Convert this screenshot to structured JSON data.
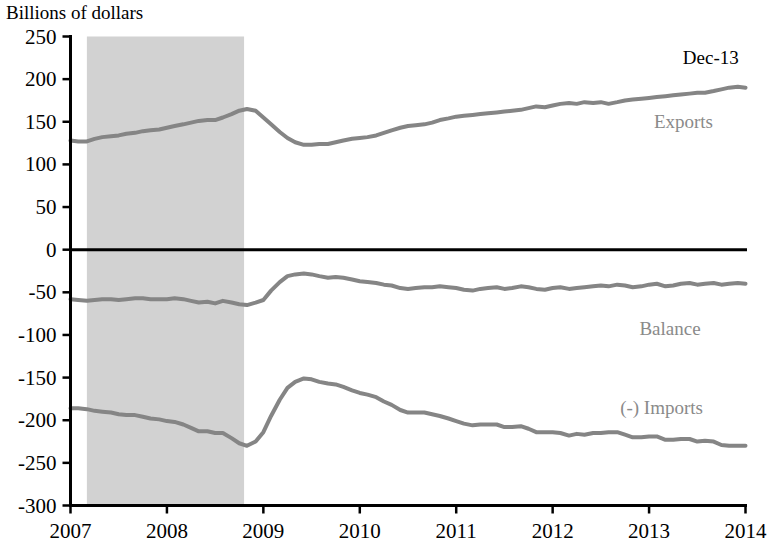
{
  "chart_data": {
    "type": "line",
    "title": "",
    "ylabel": "Billions of dollars",
    "xlabel": "",
    "ylim": [
      -300,
      250
    ],
    "xlim": [
      2007.0,
      2014.0
    ],
    "grid": false,
    "legend_position": "inline-right",
    "ytick_labels": [
      "250",
      "200",
      "150",
      "100",
      "50",
      "0",
      "-50",
      "-100",
      "-150",
      "-200",
      "-250",
      "-300"
    ],
    "yticks": [
      250,
      200,
      150,
      100,
      50,
      0,
      -50,
      -100,
      -150,
      -200,
      -250,
      -300
    ],
    "xtick_labels": [
      "2007",
      "2008",
      "2009",
      "2010",
      "2011",
      "2012",
      "2013",
      "2014"
    ],
    "xticks": [
      2007,
      2008,
      2009,
      2010,
      2011,
      2012,
      2013,
      2014
    ],
    "annotations": [
      {
        "name": "latest-period",
        "text": "Dec-13",
        "x": 2013.35,
        "y": 218
      }
    ],
    "shaded_regions": [
      {
        "name": "recession-band",
        "x_start": 2007.17,
        "x_end": 2008.8,
        "color": "#d2d2d2"
      }
    ],
    "zero_line": 0,
    "line_color": "#858585",
    "series": [
      {
        "name": "Exports",
        "label": "Exports",
        "label_x": 2013.05,
        "label_y": 143,
        "color": "#858585",
        "x": [
          2007.0,
          2007.08,
          2007.17,
          2007.25,
          2007.33,
          2007.42,
          2007.5,
          2007.58,
          2007.67,
          2007.75,
          2007.83,
          2007.92,
          2008.0,
          2008.08,
          2008.17,
          2008.25,
          2008.33,
          2008.42,
          2008.5,
          2008.58,
          2008.67,
          2008.75,
          2008.83,
          2008.92,
          2009.0,
          2009.08,
          2009.17,
          2009.25,
          2009.33,
          2009.42,
          2009.5,
          2009.58,
          2009.67,
          2009.75,
          2009.83,
          2009.92,
          2010.0,
          2010.08,
          2010.17,
          2010.25,
          2010.33,
          2010.42,
          2010.5,
          2010.58,
          2010.67,
          2010.75,
          2010.83,
          2010.92,
          2011.0,
          2011.08,
          2011.17,
          2011.25,
          2011.33,
          2011.42,
          2011.5,
          2011.58,
          2011.67,
          2011.75,
          2011.83,
          2011.92,
          2012.0,
          2012.08,
          2012.17,
          2012.25,
          2012.33,
          2012.42,
          2012.5,
          2012.58,
          2012.67,
          2012.75,
          2012.83,
          2012.92,
          2013.0,
          2013.08,
          2013.17,
          2013.25,
          2013.33,
          2013.42,
          2013.5,
          2013.58,
          2013.67,
          2013.75,
          2013.83,
          2013.92,
          2014.0
        ],
        "values": [
          128,
          127,
          127,
          130,
          132,
          133,
          134,
          136,
          137,
          139,
          140,
          141,
          143,
          145,
          147,
          149,
          151,
          152,
          152,
          155,
          159,
          163,
          165,
          163,
          155,
          147,
          138,
          131,
          126,
          123,
          123,
          124,
          124,
          126,
          128,
          130,
          131,
          132,
          134,
          137,
          140,
          143,
          145,
          146,
          147,
          149,
          152,
          154,
          156,
          157,
          158,
          159,
          160,
          161,
          162,
          163,
          164,
          166,
          168,
          167,
          169,
          171,
          172,
          171,
          173,
          172,
          173,
          171,
          173,
          175,
          176,
          177,
          178,
          179,
          180,
          181,
          182,
          183,
          184,
          184,
          186,
          188,
          190,
          191,
          190
        ]
      },
      {
        "name": "Balance",
        "label": "Balance",
        "label_x": 2012.9,
        "label_y": -100,
        "color": "#858585",
        "x": [
          2007.0,
          2007.08,
          2007.17,
          2007.25,
          2007.33,
          2007.42,
          2007.5,
          2007.58,
          2007.67,
          2007.75,
          2007.83,
          2007.92,
          2008.0,
          2008.08,
          2008.17,
          2008.25,
          2008.33,
          2008.42,
          2008.5,
          2008.58,
          2008.67,
          2008.75,
          2008.83,
          2008.92,
          2009.0,
          2009.08,
          2009.17,
          2009.25,
          2009.33,
          2009.42,
          2009.5,
          2009.58,
          2009.67,
          2009.75,
          2009.83,
          2009.92,
          2010.0,
          2010.08,
          2010.17,
          2010.25,
          2010.33,
          2010.42,
          2010.5,
          2010.58,
          2010.67,
          2010.75,
          2010.83,
          2010.92,
          2011.0,
          2011.08,
          2011.17,
          2011.25,
          2011.33,
          2011.42,
          2011.5,
          2011.58,
          2011.67,
          2011.75,
          2011.83,
          2011.92,
          2012.0,
          2012.08,
          2012.17,
          2012.25,
          2012.33,
          2012.42,
          2012.5,
          2012.58,
          2012.67,
          2012.75,
          2012.83,
          2012.92,
          2013.0,
          2013.08,
          2013.17,
          2013.25,
          2013.33,
          2013.42,
          2013.5,
          2013.58,
          2013.67,
          2013.75,
          2013.83,
          2013.92,
          2014.0
        ],
        "values": [
          -58,
          -59,
          -60,
          -59,
          -58,
          -58,
          -59,
          -58,
          -57,
          -57,
          -58,
          -58,
          -58,
          -57,
          -58,
          -60,
          -62,
          -61,
          -63,
          -60,
          -62,
          -64,
          -65,
          -62,
          -59,
          -48,
          -38,
          -31,
          -29,
          -28,
          -29,
          -31,
          -33,
          -32,
          -33,
          -35,
          -37,
          -38,
          -39,
          -41,
          -42,
          -45,
          -46,
          -45,
          -44,
          -44,
          -43,
          -44,
          -45,
          -47,
          -48,
          -46,
          -45,
          -44,
          -46,
          -45,
          -43,
          -44,
          -46,
          -47,
          -45,
          -44,
          -46,
          -45,
          -44,
          -43,
          -42,
          -43,
          -41,
          -42,
          -44,
          -43,
          -41,
          -40,
          -43,
          -42,
          -40,
          -39,
          -41,
          -40,
          -39,
          -41,
          -40,
          -39,
          -40
        ]
      },
      {
        "name": "(-) Imports",
        "label": "(-) Imports",
        "label_x": 2012.7,
        "label_y": -193,
        "color": "#858585",
        "x": [
          2007.0,
          2007.08,
          2007.17,
          2007.25,
          2007.33,
          2007.42,
          2007.5,
          2007.58,
          2007.67,
          2007.75,
          2007.83,
          2007.92,
          2008.0,
          2008.08,
          2008.17,
          2008.25,
          2008.33,
          2008.42,
          2008.5,
          2008.58,
          2008.67,
          2008.75,
          2008.83,
          2008.92,
          2009.0,
          2009.08,
          2009.17,
          2009.25,
          2009.33,
          2009.42,
          2009.5,
          2009.58,
          2009.67,
          2009.75,
          2009.83,
          2009.92,
          2010.0,
          2010.08,
          2010.17,
          2010.25,
          2010.33,
          2010.42,
          2010.5,
          2010.58,
          2010.67,
          2010.75,
          2010.83,
          2010.92,
          2011.0,
          2011.08,
          2011.17,
          2011.25,
          2011.33,
          2011.42,
          2011.5,
          2011.58,
          2011.67,
          2011.75,
          2011.83,
          2011.92,
          2012.0,
          2012.08,
          2012.17,
          2012.25,
          2012.33,
          2012.42,
          2012.5,
          2012.58,
          2012.67,
          2012.75,
          2012.83,
          2012.92,
          2013.0,
          2013.08,
          2013.17,
          2013.25,
          2013.33,
          2013.42,
          2013.5,
          2013.58,
          2013.67,
          2013.75,
          2013.83,
          2013.92,
          2014.0
        ],
        "values": [
          -186,
          -186,
          -187,
          -189,
          -190,
          -191,
          -193,
          -194,
          -194,
          -196,
          -198,
          -199,
          -201,
          -202,
          -205,
          -209,
          -213,
          -213,
          -215,
          -215,
          -221,
          -227,
          -230,
          -225,
          -214,
          -195,
          -176,
          -162,
          -155,
          -151,
          -152,
          -155,
          -157,
          -158,
          -161,
          -165,
          -168,
          -170,
          -173,
          -178,
          -182,
          -188,
          -191,
          -191,
          -191,
          -193,
          -195,
          -198,
          -201,
          -204,
          -206,
          -205,
          -205,
          -205,
          -208,
          -208,
          -207,
          -210,
          -214,
          -214,
          -214,
          -215,
          -218,
          -216,
          -217,
          -215,
          -215,
          -214,
          -214,
          -217,
          -220,
          -220,
          -219,
          -219,
          -223,
          -223,
          -222,
          -222,
          -225,
          -224,
          -225,
          -229,
          -230,
          -230,
          -230
        ]
      }
    ]
  }
}
